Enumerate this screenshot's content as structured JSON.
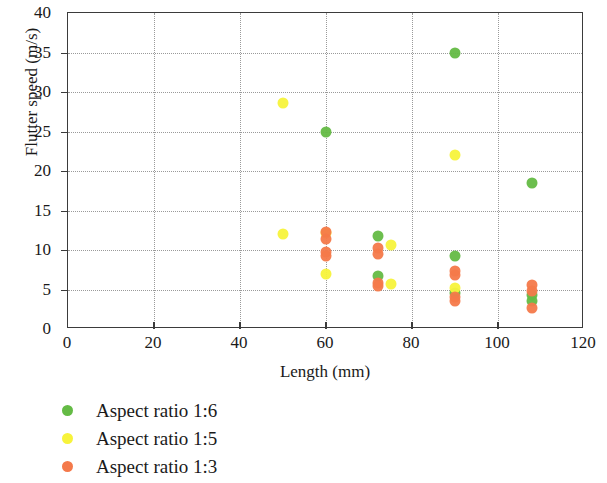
{
  "chart_data": {
    "type": "scatter",
    "title": "",
    "xlabel": "Length (mm)",
    "ylabel": "Flutter speed (m/s)",
    "xlim": [
      0,
      120
    ],
    "ylim": [
      0,
      40
    ],
    "xticks": [
      0,
      20,
      40,
      60,
      80,
      100,
      120
    ],
    "yticks": [
      0,
      5,
      10,
      15,
      20,
      25,
      30,
      35,
      40
    ],
    "xtick_labels": [
      "0",
      "20",
      "40",
      "60",
      "80",
      "100",
      "120"
    ],
    "ytick_labels": [
      "0",
      "5",
      "10",
      "15",
      "20",
      "25",
      "30",
      "35",
      "40"
    ],
    "grid": "dotted",
    "legend_position": "below-left",
    "series": [
      {
        "name": "Aspect ratio 1:6",
        "color": "#64bb45",
        "points": [
          [
            60,
            25.0
          ],
          [
            72,
            11.8
          ],
          [
            72,
            6.7
          ],
          [
            90,
            35.0
          ],
          [
            90,
            9.2
          ],
          [
            90,
            4.6
          ],
          [
            108,
            18.5
          ],
          [
            108,
            4.3
          ],
          [
            108,
            3.5
          ]
        ]
      },
      {
        "name": "Aspect ratio 1:5",
        "color": "#f7f33b",
        "points": [
          [
            50,
            28.6
          ],
          [
            50,
            12.0
          ],
          [
            60,
            12.1
          ],
          [
            60,
            7.0
          ],
          [
            75,
            10.6
          ],
          [
            75,
            5.7
          ],
          [
            90,
            22.0
          ],
          [
            90,
            5.2
          ]
        ]
      },
      {
        "name": "Aspect ratio 1:3",
        "color": "#f4794a",
        "points": [
          [
            60,
            12.3
          ],
          [
            60,
            11.4
          ],
          [
            60,
            9.8
          ],
          [
            60,
            9.2
          ],
          [
            72,
            10.2
          ],
          [
            72,
            9.5
          ],
          [
            72,
            5.8
          ],
          [
            72,
            5.4
          ],
          [
            90,
            7.4
          ],
          [
            90,
            6.8
          ],
          [
            90,
            4.0
          ],
          [
            90,
            3.5
          ],
          [
            108,
            5.6
          ],
          [
            108,
            4.8
          ],
          [
            108,
            2.6
          ]
        ]
      }
    ]
  }
}
